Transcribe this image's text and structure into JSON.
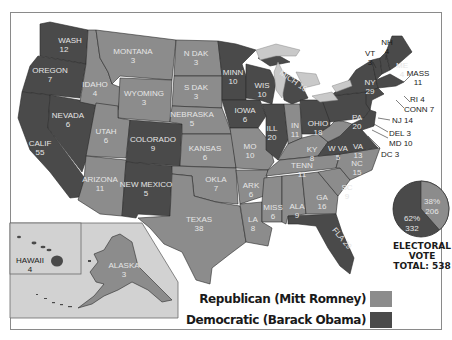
{
  "colors": {
    "republican": "#8c8c8c",
    "democratic": "#4a4a4a",
    "water": "#c9c9c9",
    "inset_bg": "#d2d2d2",
    "text_on_state": "#e6e6e6"
  },
  "legend": {
    "republican_label": "Republican (Mitt Romney)",
    "democratic_label": "Democratic (Barack Obama)"
  },
  "pie": {
    "republican_pct": "38%",
    "republican_votes": "206",
    "democratic_pct": "62%",
    "democratic_votes": "332"
  },
  "caption": {
    "line1": "ELECTORAL",
    "line2": "VOTE",
    "line3": "TOTAL: 538"
  },
  "states": {
    "wash": {
      "name": "WASH",
      "ev": "12",
      "party": "D"
    },
    "oregon": {
      "name": "OREGON",
      "ev": "7",
      "party": "D"
    },
    "calif": {
      "name": "CALIF",
      "ev": "55",
      "party": "D"
    },
    "nevada": {
      "name": "NEVADA",
      "ev": "6",
      "party": "D"
    },
    "idaho": {
      "name": "IDAHO",
      "ev": "4",
      "party": "R"
    },
    "montana": {
      "name": "MONTANA",
      "ev": "3",
      "party": "R"
    },
    "wyoming": {
      "name": "WYOMING",
      "ev": "3",
      "party": "R"
    },
    "utah": {
      "name": "UTAH",
      "ev": "6",
      "party": "R"
    },
    "colorado": {
      "name": "COLORADO",
      "ev": "9",
      "party": "D"
    },
    "arizona": {
      "name": "ARIZONA",
      "ev": "11",
      "party": "R"
    },
    "new_mexico": {
      "name": "NEW MEXICO",
      "ev": "5",
      "party": "D"
    },
    "n_dak": {
      "name": "N DAK",
      "ev": "3",
      "party": "R"
    },
    "s_dak": {
      "name": "S DAK",
      "ev": "3",
      "party": "R"
    },
    "nebraska": {
      "name": "NEBRASKA",
      "ev": "5",
      "party": "R"
    },
    "kansas": {
      "name": "KANSAS",
      "ev": "6",
      "party": "R"
    },
    "okla": {
      "name": "OKLA",
      "ev": "7",
      "party": "R"
    },
    "texas": {
      "name": "TEXAS",
      "ev": "38",
      "party": "R"
    },
    "minn": {
      "name": "MINN",
      "ev": "10",
      "party": "D"
    },
    "iowa": {
      "name": "IOWA",
      "ev": "6",
      "party": "D"
    },
    "mo": {
      "name": "MO",
      "ev": "10",
      "party": "R"
    },
    "ark": {
      "name": "ARK",
      "ev": "6",
      "party": "R"
    },
    "la": {
      "name": "LA",
      "ev": "8",
      "party": "R"
    },
    "wis": {
      "name": "WIS",
      "ev": "10",
      "party": "D"
    },
    "ill": {
      "name": "ILL",
      "ev": "20",
      "party": "D"
    },
    "mich": {
      "name": "MICH",
      "ev": "16",
      "party": "D"
    },
    "in": {
      "name": "IN",
      "ev": "11",
      "party": "R"
    },
    "ohio": {
      "name": "OHIO",
      "ev": "18",
      "party": "D"
    },
    "ky": {
      "name": "KY",
      "ev": "8",
      "party": "R"
    },
    "tenn": {
      "name": "TENN",
      "ev": "11",
      "party": "R"
    },
    "miss": {
      "name": "MISS",
      "ev": "6",
      "party": "R"
    },
    "ala": {
      "name": "ALA",
      "ev": "9",
      "party": "R"
    },
    "ga": {
      "name": "GA",
      "ev": "16",
      "party": "R"
    },
    "fla": {
      "name": "FLA",
      "ev": "29",
      "party": "D"
    },
    "sc": {
      "name": "SC",
      "ev": "9",
      "party": "R"
    },
    "nc": {
      "name": "NC",
      "ev": "15",
      "party": "R"
    },
    "va": {
      "name": "VA",
      "ev": "13",
      "party": "D"
    },
    "w_va": {
      "name": "W VA",
      "ev": "5",
      "party": "R"
    },
    "pa": {
      "name": "PA",
      "ev": "20",
      "party": "D"
    },
    "ny": {
      "name": "NY",
      "ev": "29",
      "party": "D"
    },
    "vt": {
      "name": "VT",
      "ev": "3",
      "party": "D"
    },
    "nh": {
      "name": "NH",
      "ev": "4",
      "party": "D"
    },
    "me": {
      "name": "ME",
      "ev": "4",
      "party": "D"
    },
    "mass": {
      "name": "MASS",
      "ev": "11",
      "party": "D"
    },
    "ri": {
      "label": "RI 4",
      "party": "D"
    },
    "conn": {
      "label": "CONN 7",
      "party": "D"
    },
    "nj": {
      "label": "NJ 14",
      "party": "D"
    },
    "del": {
      "label": "DEL 3",
      "party": "D"
    },
    "md": {
      "label": "MD 10",
      "party": "D"
    },
    "dc": {
      "label": "DC 3",
      "party": "D"
    },
    "alaska": {
      "name": "ALASKA",
      "ev": "3",
      "party": "R"
    },
    "hawaii": {
      "name": "HAWAII",
      "ev": "4",
      "party": "D"
    }
  }
}
